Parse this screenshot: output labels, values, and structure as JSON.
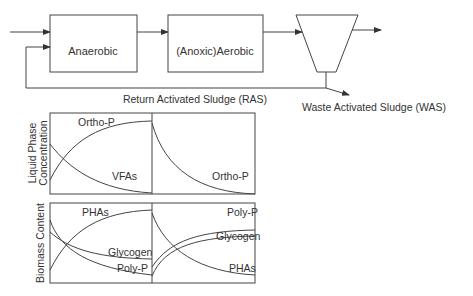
{
  "process": {
    "tank1_label": "Anaerobic",
    "tank2_label": "(Anoxic)Aerobic",
    "ras_label": "Return Activated Sludge (RAS)",
    "was_label": "Waste Activated Sludge (WAS)"
  },
  "liquid_chart": {
    "ylabel_line1": "Liquid Phase",
    "ylabel_line2": "Concentration",
    "curve_orthop_anaerobic": "Ortho-P",
    "curve_vfas": "VFAs",
    "curve_orthop_aerobic": "Ortho-P"
  },
  "biomass_chart": {
    "ylabel": "Biomass Content",
    "curve_phas_anaerobic": "PHAs",
    "curve_glycogen_anaerobic": "Glycogen",
    "curve_polyp_anaerobic": "Poly-P",
    "curve_polyp_aerobic": "Poly-P",
    "curve_glycogen_aerobic": "Glycogen",
    "curve_phas_aerobic": "PHAs"
  },
  "colors": {
    "line": "#333333",
    "background": "#ffffff"
  }
}
